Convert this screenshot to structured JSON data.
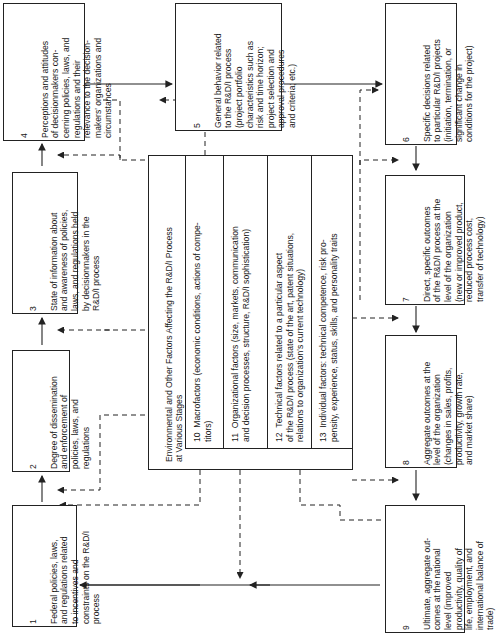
{
  "boxes": {
    "b1": {
      "num": "1",
      "text": "Federal policies, laws,\nand regulations related\nto incentives and\nconstraints on the R&D/I\nprocess"
    },
    "b2": {
      "num": "2",
      "text": "Degree of dissemination\nand enforcement of\npolicies, laws, and\nregulations"
    },
    "b3": {
      "num": "3",
      "text": "State of information about\nand awareness of policies,\nlaws, and regulations held\nby decisionmakers in the\nR&D/I process"
    },
    "b4": {
      "num": "4",
      "text": "Perceptions and attitudes\nof decisionmakers con-\ncerning policies, laws, and\nregulations and their\nrelevance to the decision-\nmakers' organizations and\ncircumstances"
    },
    "b5": {
      "num": "5",
      "text": "General behavior related\nto the R&D/I process\n(project portfolio\ncharacteristics such as\nrisk and time horizon;\nproject selection and\napproval procedures\nand criteria; etc.)"
    },
    "b6": {
      "num": "6",
      "text": "Specific decisions related\nto particular R&D/I projects\n(initiation, termination, or\nsignificant change in\nconditions for the project)"
    },
    "b7": {
      "num": "7",
      "text": "Direct, specific outcomes\nof the R&D/I process at the\nlevel of the organization\n(new or improved product,\nreduced process cost,\ntransfer of technology)"
    },
    "b8": {
      "num": "8",
      "text": "Aggregate outcomes at the\nlevel of the organization\n(changes in sales, profits,\nproductivity, growth rate,\nand market share)"
    },
    "b9": {
      "num": "9",
      "text": "Ultimate, aggregate out-\ncomes at the national\nlevel (improved\nproductivity, quality of\nlife, employment, and\ninternational balance of\ntrade)"
    }
  },
  "environment": {
    "title": "Environmental and Other Factors Affecting the R&D/I Process\nat Various Stages",
    "factors": [
      {
        "num": "10",
        "text": "Macrofactors (economic conditions, actions of compe-\ntitors)"
      },
      {
        "num": "11",
        "text": "Organizational factors (size, markets, communication\nand decision processes, structure, R&D/I sophistication)"
      },
      {
        "num": "12",
        "text": "Technical factors related to a particular aspect\nof the R&D/I process (state of the art, patent situations,\nrelations to organization's current technology)"
      },
      {
        "num": "13",
        "text": "Individual factors: technical competence, risk pro-\npensity, experience, status, skills, and personality traits"
      }
    ]
  }
}
